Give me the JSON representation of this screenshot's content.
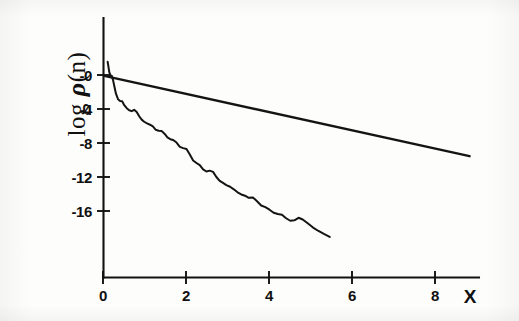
{
  "figure": {
    "background_color": "#fdfdfc",
    "ink_color": "#141414",
    "caption": ""
  },
  "axes": {
    "x_axis_name": "X",
    "y_axis_name_prefix": "log ",
    "y_axis_name_symbol": "ρ",
    "y_axis_name_suffix": "(n)",
    "x_tick_labels": [
      "0",
      "2",
      "4",
      "6",
      "8"
    ],
    "y_tick_labels": [
      "-0",
      "-4",
      "-8",
      "-12",
      "-16"
    ]
  },
  "chart_data": {
    "type": "line",
    "title": "",
    "subtitle": "",
    "xlabel": "X",
    "ylabel": "log ρ(n)",
    "xlim": [
      -0.15,
      9.2
    ],
    "ylim": [
      -20.5,
      2.2
    ],
    "xticks": [
      0,
      2,
      4,
      6,
      8
    ],
    "yticks": [
      0,
      -4,
      -8,
      -12,
      -16
    ],
    "xtick_labels": [
      "0",
      "2",
      "4",
      "6",
      "8"
    ],
    "ytick_labels": [
      "-0",
      "-4",
      "-8",
      "-12",
      "-16"
    ],
    "grid": false,
    "legend": null,
    "legend_position": "none",
    "annotations": [],
    "series": [
      {
        "name": "straight-reference-line",
        "style": "solid",
        "color": "#141414",
        "x": [
          0.02,
          8.82
        ],
        "y": [
          -0.1,
          -9.55
        ]
      },
      {
        "name": "jagged-decay-curve",
        "style": "solid",
        "color": "#141414",
        "x": [
          0.1,
          0.12,
          0.14,
          0.17,
          0.2,
          0.23,
          0.26,
          0.3,
          0.35,
          0.4,
          0.45,
          0.5,
          0.56,
          0.62,
          0.68,
          0.74,
          0.8,
          0.86,
          0.92,
          0.98,
          1.05,
          1.12,
          1.19,
          1.26,
          1.33,
          1.4,
          1.47,
          1.54,
          1.61,
          1.68,
          1.76,
          1.84,
          1.92,
          2.0,
          2.08,
          2.16,
          2.24,
          2.32,
          2.4,
          2.48,
          2.56,
          2.64,
          2.72,
          2.8,
          2.88,
          2.96,
          3.05,
          3.14,
          3.23,
          3.32,
          3.41,
          3.5,
          3.6,
          3.7,
          3.8,
          3.9,
          4.0,
          4.1,
          4.2,
          4.3,
          4.4,
          4.5,
          4.6,
          4.7,
          4.8,
          4.92,
          5.05,
          5.18,
          5.31,
          5.45
        ],
        "y": [
          1.55,
          0.95,
          0.3,
          -0.05,
          -0.1,
          -0.6,
          -1.3,
          -2.2,
          -2.85,
          -3.05,
          -3.1,
          -3.55,
          -3.9,
          -4.15,
          -4.25,
          -4.1,
          -4.35,
          -4.85,
          -5.25,
          -5.5,
          -5.7,
          -5.85,
          -6.05,
          -6.45,
          -6.55,
          -6.6,
          -6.9,
          -7.35,
          -7.55,
          -7.65,
          -7.95,
          -8.45,
          -8.6,
          -8.7,
          -9.35,
          -10.05,
          -10.35,
          -10.6,
          -11.1,
          -11.35,
          -11.25,
          -11.4,
          -12.0,
          -12.45,
          -12.7,
          -12.95,
          -13.15,
          -13.45,
          -13.8,
          -14.05,
          -14.2,
          -14.45,
          -14.4,
          -14.85,
          -15.35,
          -15.55,
          -15.85,
          -16.2,
          -16.35,
          -16.45,
          -16.85,
          -17.15,
          -17.1,
          -16.8,
          -17.0,
          -17.45,
          -17.95,
          -18.35,
          -18.7,
          -19.05
        ]
      }
    ]
  }
}
